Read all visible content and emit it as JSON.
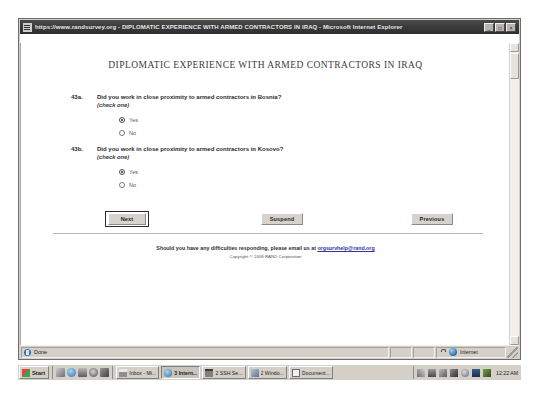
{
  "window": {
    "title": "https://www.randsurvey.org - DIPLOMATIC EXPERIENCE WITH ARMED CONTRACTORS IN IRAQ - Microsoft Internet Explorer",
    "minimize_label": "_",
    "maximize_label": "□",
    "close_label": "×"
  },
  "survey": {
    "heading": "DIPLOMATIC EXPERIENCE WITH ARMED CONTRACTORS IN IRAQ",
    "questions": [
      {
        "number": "43a.",
        "text": "Did you work in close proximity to armed contractors in Bosnia?",
        "instruction": "(check one)",
        "options": [
          {
            "label": "Yes",
            "checked": true
          },
          {
            "label": "No",
            "checked": false
          }
        ]
      },
      {
        "number": "43b.",
        "text": "Did you work in close proximity to armed contractors in Kosovo?",
        "instruction": "(check one)",
        "options": [
          {
            "label": "Yes",
            "checked": true
          },
          {
            "label": "No",
            "checked": false
          }
        ]
      }
    ],
    "buttons": {
      "next": "Next",
      "suspend": "Suspend",
      "previous": "Previous"
    },
    "footer": {
      "message_before_link": "Should you have any difficulties responding, please email us at ",
      "link": "orgsurvhelp@rand.org",
      "copyright": "Copyright © 2008 RAND Corporation"
    }
  },
  "status_bar": {
    "text": "Done",
    "zone": "Internet"
  },
  "taskbar": {
    "start": "Start",
    "items": [
      {
        "label": "Inbox - Mi...",
        "icon": "mail",
        "active": false
      },
      {
        "label": "3 Intern...",
        "icon": "ie",
        "active": true
      },
      {
        "label": "2 SSH Se...",
        "icon": "ssh",
        "active": false
      },
      {
        "label": "2 Windo...",
        "icon": "win",
        "active": false
      },
      {
        "label": "Document...",
        "icon": "doc",
        "active": false
      }
    ],
    "clock": "12:22 AM"
  },
  "colors": {
    "chrome": "#d4d0c8",
    "title_bar": "#3a3a3a",
    "link": "#33339a",
    "page": "#ffffff"
  }
}
